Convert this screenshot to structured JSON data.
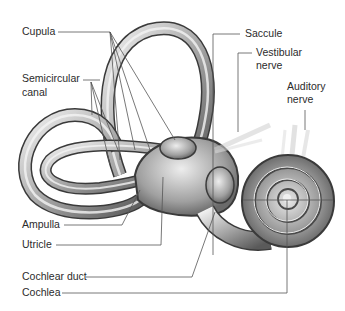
{
  "diagram": {
    "labels": {
      "cupula": "Cupula",
      "semicircular_canal_line1": "Semicircular",
      "semicircular_canal_line2": "canal",
      "saccule": "Saccule",
      "vestibular_nerve_line1": "Vestibular",
      "vestibular_nerve_line2": "nerve",
      "auditory_nerve_line1": "Auditory",
      "auditory_nerve_line2": "nerve",
      "ampulla": "Ampulla",
      "utricle": "Utricle",
      "cochlear_duct": "Cochlear duct",
      "cochlea": "Cochlea"
    },
    "colors": {
      "background": "#ffffff",
      "leader_line": "#555555",
      "structure_light": "#e6e6e6",
      "structure_mid": "#9a9a9a",
      "structure_dark": "#3a3a3a",
      "text": "#2b2b2b"
    }
  }
}
